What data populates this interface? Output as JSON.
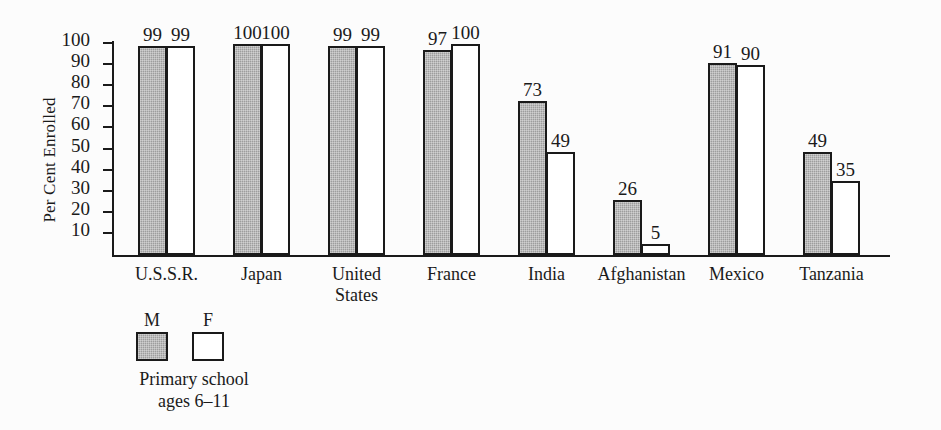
{
  "chart_data": {
    "type": "bar",
    "title": "",
    "xlabel": "",
    "ylabel": "Per Cent Enrolled",
    "ylim": [
      0,
      100
    ],
    "yticks": [
      10,
      20,
      30,
      40,
      50,
      60,
      70,
      80,
      90,
      100
    ],
    "grid": false,
    "legend_position": "below-left",
    "categories": [
      "U.S.S.R.",
      "Japan",
      "United\nStates",
      "France",
      "India",
      "Afghanistan",
      "Mexico",
      "Tanzania"
    ],
    "series": [
      {
        "name": "M",
        "values": [
          99,
          100,
          99,
          97,
          73,
          26,
          91,
          49
        ]
      },
      {
        "name": "F",
        "values": [
          99,
          100,
          99,
          100,
          49,
          5,
          90,
          35
        ]
      }
    ],
    "annotations": {
      "legend_caption": "Primary school\nages 6–11"
    },
    "colors": {
      "male_fill": "#9d9d9d",
      "female_fill": "#ffffff",
      "outline": "#1a1a1a",
      "background": "#fcfcfc"
    }
  }
}
